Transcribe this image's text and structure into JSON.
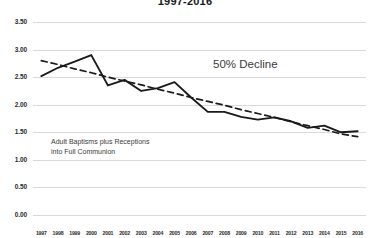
{
  "chart_data": {
    "type": "line",
    "title": "1997-2016",
    "xlabel": "",
    "ylabel": "",
    "ylim": [
      0.0,
      3.5
    ],
    "ytick_labels": [
      "3.50",
      "3.00",
      "2.50",
      "2.00",
      "1.50",
      "1.00",
      "0.50",
      "0.00"
    ],
    "yticks": [
      3.5,
      3.0,
      2.5,
      2.0,
      1.5,
      1.0,
      0.5,
      0.0
    ],
    "grid": true,
    "legend": "none",
    "categories": [
      "1997",
      "1998",
      "1999",
      "2000",
      "2001",
      "2002",
      "2003",
      "2004",
      "2005",
      "2006",
      "2007",
      "2008",
      "2009",
      "2010",
      "2011",
      "2012",
      "2013",
      "2014",
      "2015",
      "2016"
    ],
    "x": [
      1997,
      1998,
      1999,
      2000,
      2001,
      2002,
      2003,
      2004,
      2005,
      2006,
      2007,
      2008,
      2009,
      2010,
      2011,
      2012,
      2013,
      2014,
      2015,
      2016
    ],
    "series": [
      {
        "name": "Adult Baptisms plus Receptions into Full Communion",
        "style": "solid",
        "color": "#1a1a1a",
        "values": [
          2.52,
          2.67,
          2.78,
          2.9,
          2.35,
          2.45,
          2.25,
          2.3,
          2.41,
          2.13,
          1.87,
          1.87,
          1.78,
          1.73,
          1.77,
          1.7,
          1.58,
          1.62,
          1.5,
          1.52
        ]
      },
      {
        "name": "Trendline",
        "style": "dashed",
        "color": "#1a1a1a",
        "values": [
          2.8,
          2.73,
          2.65,
          2.58,
          2.5,
          2.43,
          2.36,
          2.28,
          2.21,
          2.13,
          2.06,
          1.99,
          1.91,
          1.84,
          1.77,
          1.69,
          1.62,
          1.55,
          1.47,
          1.42
        ]
      }
    ],
    "annotations": [
      {
        "id": "decline",
        "text": "50% Decline"
      },
      {
        "id": "series-label-line1",
        "text": "Adult Baptisms plus Receptions"
      },
      {
        "id": "series-label-line2",
        "text": "into Full Communion"
      }
    ]
  }
}
